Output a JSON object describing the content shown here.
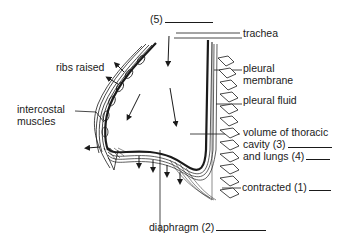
{
  "diagram": {
    "labels": {
      "blank5": "(5)",
      "trachea": "trachea",
      "ribs_raised": "ribs raised",
      "pleural_membrane_1": "pleural",
      "pleural_membrane_2": "membrane",
      "pleural_fluid": "pleural fluid",
      "intercostal_1": "intercostal",
      "intercostal_2": "muscles",
      "volume_1": "volume of thoracic",
      "volume_2": "cavity (3)",
      "volume_3": "and lungs (4)",
      "contracted": "contracted (1)",
      "diaphragm": "diaphragm (2)"
    },
    "colors": {
      "ink": "#1a1a1a",
      "background": "#ffffff"
    }
  }
}
